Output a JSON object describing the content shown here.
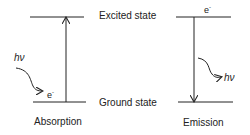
{
  "labels": {
    "excited_state": "Excited state",
    "ground_state": "Ground state",
    "absorption": "Absorption",
    "emission": "Emission"
  },
  "photon": {
    "symbol": "hν"
  },
  "electron": {
    "symbol": "e",
    "charge": "-"
  },
  "colors": {
    "line": "#222222",
    "background": "#ffffff"
  }
}
